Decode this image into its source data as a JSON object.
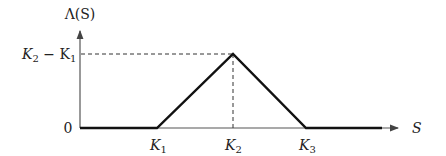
{
  "diagram": {
    "y_axis_label": "Λ(S)",
    "x_axis_label": "S",
    "y_ticks": [
      {
        "label": "0",
        "value": 0
      },
      {
        "label_main": "K",
        "sub1": "2",
        "minus": " − K",
        "sub2": "1",
        "value": "K2 - K1"
      }
    ],
    "x_ticks": [
      {
        "main": "K",
        "sub": "1"
      },
      {
        "main": "K",
        "sub": "2"
      },
      {
        "main": "K",
        "sub": "3"
      }
    ],
    "payoff_points": [
      {
        "x": "0",
        "y": "0"
      },
      {
        "x": "K1",
        "y": "0"
      },
      {
        "x": "K2",
        "y": "K2 - K1"
      },
      {
        "x": "K3",
        "y": "0"
      },
      {
        "x": "beyond",
        "y": "0"
      }
    ],
    "colors": {
      "line": "#111111",
      "axis": "#444444",
      "guide": "#333333"
    }
  }
}
